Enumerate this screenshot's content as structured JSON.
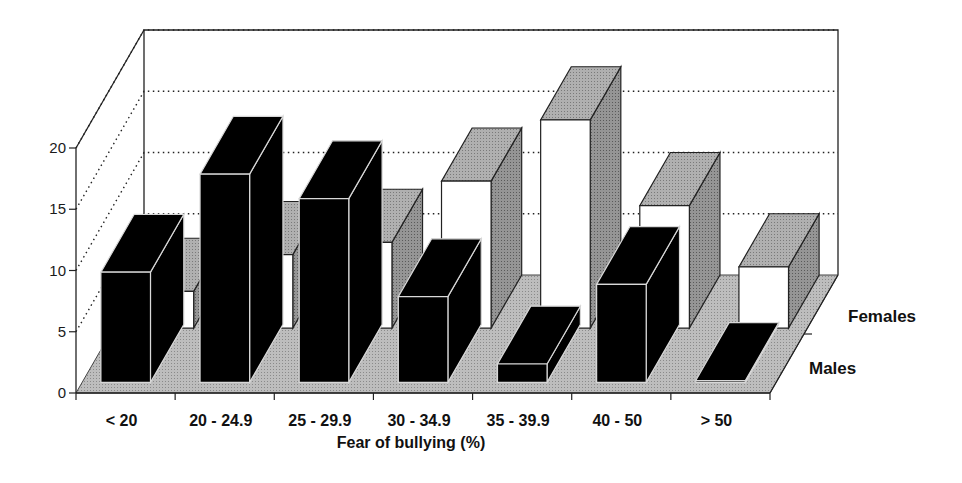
{
  "chart_data": {
    "type": "bar",
    "subtype": "3d-grouped-depth",
    "title": "",
    "xlabel": "Fear of bullying (%)",
    "ylabel": "",
    "ylim": [
      0,
      20
    ],
    "yticks": [
      0,
      5,
      10,
      15,
      20
    ],
    "grid": true,
    "categories": [
      "< 20",
      "20 - 24.9",
      "25 - 29.9",
      "30 - 34.9",
      "35 - 39.9",
      "40 - 50",
      "> 50"
    ],
    "series": [
      {
        "name": "Males",
        "color": "#000000",
        "values": [
          9,
          17,
          15,
          7,
          1.5,
          8,
          0
        ]
      },
      {
        "name": "Females",
        "color": "#ffffff",
        "values": [
          3,
          6,
          7,
          12,
          17,
          10,
          5
        ]
      }
    ],
    "depth_labels": [
      "Females",
      "Males"
    ],
    "legend_position": "right (depth axis labels)"
  },
  "colors": {
    "floor": "#b8b8b8",
    "bar_top": "#a8a8a8",
    "bar_side": "#8c8c8c",
    "male_face": "#000000",
    "female_face": "#ffffff",
    "axis": "#222222"
  }
}
